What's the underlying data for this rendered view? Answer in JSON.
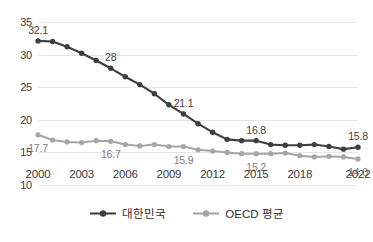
{
  "chart_data": {
    "type": "line",
    "title": "",
    "subtitle": "",
    "xlabel": "",
    "ylabel": "",
    "ylim": [
      10,
      35
    ],
    "yticks": [
      10,
      15,
      20,
      25,
      30,
      35
    ],
    "xticks": [
      "2000",
      "2003",
      "2006",
      "2009",
      "2012",
      "2015",
      "2018",
      "2022"
    ],
    "x": [
      2000,
      2001,
      2002,
      2003,
      2004,
      2005,
      2006,
      2007,
      2008,
      2009,
      2010,
      2011,
      2012,
      2013,
      2014,
      2015,
      2016,
      2017,
      2018,
      2019,
      2020,
      2021,
      2022
    ],
    "grid": "horizontal",
    "legend_position": "bottom-center",
    "series": [
      {
        "name": "대한민국",
        "color": "#3f3f3f",
        "marker": "circle",
        "values": [
          32.1,
          32.0,
          31.2,
          30.2,
          29.1,
          27.9,
          26.6,
          25.4,
          24.0,
          22.3,
          20.9,
          19.4,
          18.1,
          17.0,
          16.8,
          16.8,
          16.2,
          16.1,
          16.1,
          16.2,
          15.9,
          15.5,
          15.8
        ],
        "labels": [
          {
            "x": 2000,
            "text": "32.1"
          },
          {
            "x": 2005,
            "text": "28"
          },
          {
            "x": 2010,
            "text": "21.1"
          },
          {
            "x": 2015,
            "text": "16.8"
          },
          {
            "x": 2022,
            "text": "15.8"
          }
        ]
      },
      {
        "name": "OECD 평균",
        "color": "#a6a6a6",
        "marker": "circle",
        "values": [
          17.7,
          16.9,
          16.6,
          16.5,
          16.8,
          16.7,
          16.2,
          16.0,
          16.2,
          15.9,
          15.9,
          15.4,
          15.2,
          15.0,
          14.8,
          14.8,
          14.8,
          14.9,
          14.5,
          14.3,
          14.4,
          14.3,
          14.0
        ],
        "labels": [
          {
            "x": 2000,
            "text": "17.7"
          },
          {
            "x": 2005,
            "text": "16.7"
          },
          {
            "x": 2010,
            "text": "15.9"
          },
          {
            "x": 2015,
            "text": "15.2"
          },
          {
            "x": 2022,
            "text": "14.0"
          }
        ]
      }
    ]
  },
  "legend": {
    "items": [
      {
        "label": "대한민국",
        "color": "#3f3f3f"
      },
      {
        "label": "OECD 평균",
        "color": "#a6a6a6"
      }
    ]
  },
  "colors": {
    "korea": "#3f3f3f",
    "oecd": "#a6a6a6",
    "grid": "#e6e6e6",
    "tick_text": "#3a3a3a",
    "background": "#ffffff"
  }
}
